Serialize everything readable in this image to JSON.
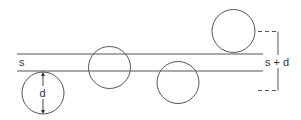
{
  "diagram": {
    "labels": {
      "s": "s",
      "d": "d",
      "s_plus_d": "s + d"
    },
    "colors": {
      "stroke": "#555555",
      "text": "#333333",
      "background": "#ffffff"
    }
  }
}
